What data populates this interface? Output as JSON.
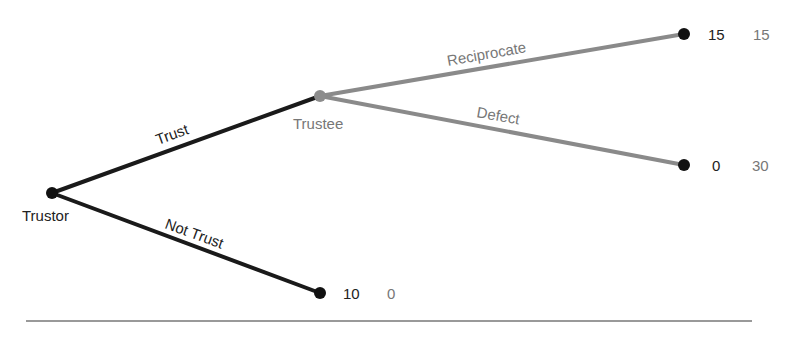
{
  "diagram": {
    "type": "game-tree",
    "colors": {
      "trustor_edges": "#1a1a1a",
      "trustee_edges": "#8a8a8a",
      "trustor_node": "#111111",
      "trustee_node": "#8c8c8c",
      "terminal_node": "#111111",
      "payoff_trustor": "#222222",
      "payoff_trustee": "#888888",
      "divider": "#777777"
    },
    "nodes": {
      "trustor": {
        "label": "Trustor"
      },
      "trustee": {
        "label": "Trustee"
      }
    },
    "edges": {
      "trust": {
        "label": "Trust"
      },
      "not_trust": {
        "label": "Not Trust"
      },
      "reciprocate": {
        "label": "Reciprocate"
      },
      "defect": {
        "label": "Defect"
      }
    },
    "payoffs": {
      "reciprocate": {
        "trustor": "15",
        "trustee": "15"
      },
      "defect": {
        "trustor": "0",
        "trustee": "30"
      },
      "not_trust": {
        "trustor": "10",
        "trustee": "0"
      }
    }
  }
}
